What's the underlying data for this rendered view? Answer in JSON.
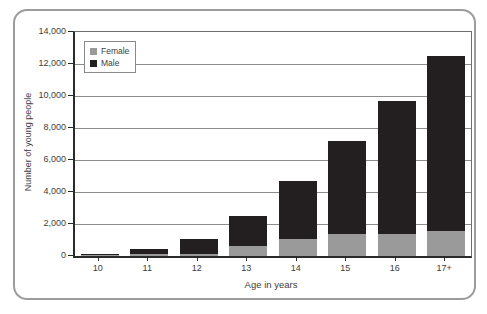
{
  "figure": {
    "border_color": "#9c9c9c",
    "background": "#ffffff"
  },
  "chart_data": {
    "type": "bar",
    "stacked": true,
    "title": "",
    "xlabel": "Age in years",
    "ylabel": "Number of young people",
    "categories": [
      "10",
      "11",
      "12",
      "13",
      "14",
      "15",
      "16",
      "17+"
    ],
    "series": [
      {
        "name": "Female",
        "color": "#9a9a9a",
        "values": [
          50,
          100,
          150,
          650,
          1050,
          1350,
          1400,
          1550
        ]
      },
      {
        "name": "Male",
        "color": "#231f20",
        "values": [
          100,
          350,
          900,
          1850,
          3650,
          5850,
          8300,
          10950
        ]
      }
    ],
    "totals": [
      150,
      450,
      1050,
      2500,
      4700,
      7200,
      9700,
      12500
    ],
    "ylim": [
      0,
      14000
    ],
    "ytick_step": 2000,
    "ytick_labels": [
      "0",
      "2,000",
      "4,000",
      "6,000",
      "8,000",
      "10,000",
      "12,000",
      "14,000"
    ],
    "grid": true,
    "legend_position": "top-left"
  }
}
